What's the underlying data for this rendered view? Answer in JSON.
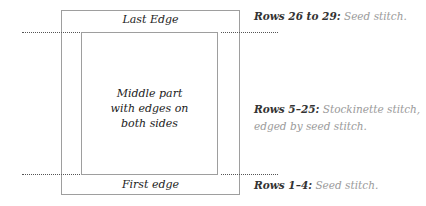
{
  "diagram": {
    "top_edge_label": "Last Edge",
    "middle_label_lines": [
      "Middle part",
      "with edges on",
      "both sides"
    ],
    "bottom_edge_label": "First edge"
  },
  "notes": [
    {
      "bold": "Rows 26 to 29:",
      "text": " Seed stitch."
    },
    {
      "bold": "Rows 5–25:",
      "text": " Stockinette stitch,",
      "text2": "edged by seed stitch."
    },
    {
      "bold": "Rows 1–4:",
      "text": " Seed stitch."
    }
  ],
  "colors": {
    "box": "#9e9e9e",
    "dots": "#555555",
    "note_light": "#9a9a9a"
  }
}
